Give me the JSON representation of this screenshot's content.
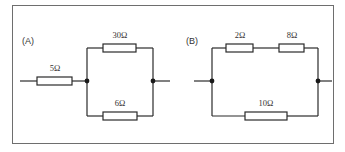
{
  "figure": {
    "panels": [
      {
        "label": "(A)",
        "description": "5 ohm resistor in series with parallel combination of 30 ohm and 6 ohm",
        "resistors": [
          {
            "name": "R1",
            "value": "5Ω",
            "position": "series-input"
          },
          {
            "name": "R2",
            "value": "30Ω",
            "position": "parallel-top"
          },
          {
            "name": "R3",
            "value": "6Ω",
            "position": "parallel-bottom"
          }
        ]
      },
      {
        "label": "(B)",
        "description": "2 ohm and 8 ohm in series, in parallel with 10 ohm",
        "resistors": [
          {
            "name": "R1",
            "value": "2Ω",
            "position": "top-left"
          },
          {
            "name": "R2",
            "value": "8Ω",
            "position": "top-right"
          },
          {
            "name": "R3",
            "value": "10Ω",
            "position": "bottom"
          }
        ]
      }
    ],
    "colors": {
      "line": "#2a2a2a",
      "frame": "#6e6e6e",
      "background": "#ffffff"
    }
  }
}
